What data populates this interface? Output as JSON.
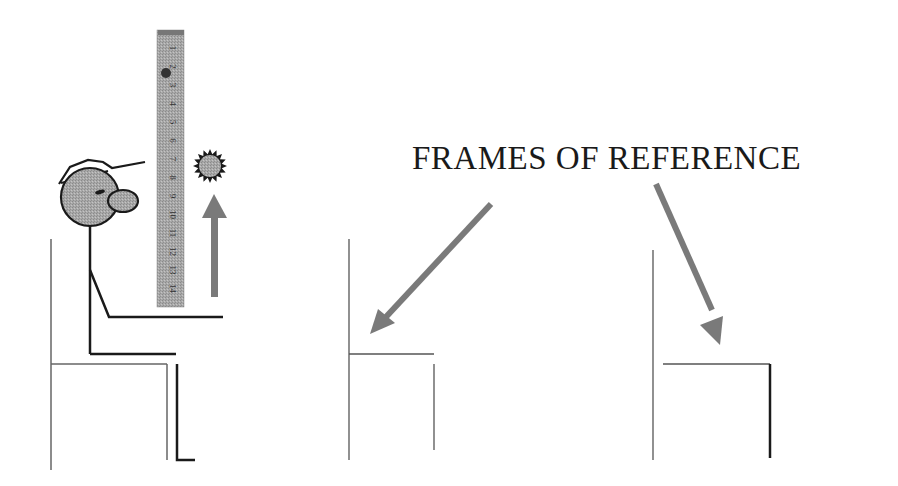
{
  "title": "FRAMES OF REFERENCE",
  "ruler": {
    "labels": [
      "1",
      "2",
      "3",
      "4",
      "5",
      "6",
      "7",
      "8",
      "9",
      "10",
      "11",
      "12",
      "13",
      "14"
    ]
  },
  "colors": {
    "line_dark": "#1a1a1a",
    "line_thin": "#555555",
    "fill_gray": "#8c8c8c",
    "arrow_gray": "#7a7a7a",
    "ruler_fill": "#b0b0b0",
    "background": "#ffffff"
  },
  "figures": [
    {
      "name": "person-on-chair-with-ruler",
      "label": ""
    },
    {
      "name": "frame-chair-1",
      "label": ""
    },
    {
      "name": "frame-chair-2",
      "label": ""
    }
  ]
}
